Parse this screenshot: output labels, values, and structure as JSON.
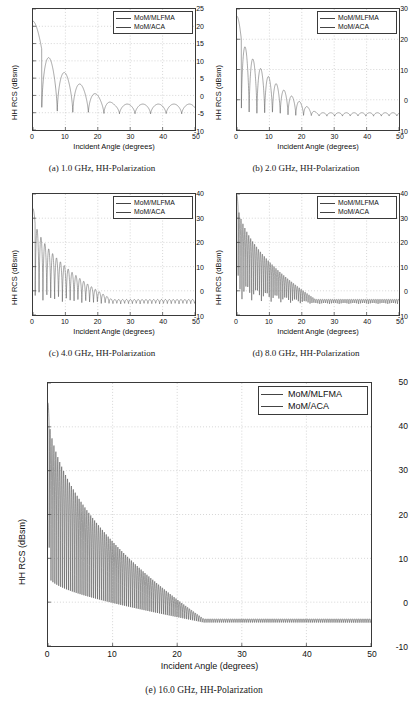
{
  "figure": {
    "axis_x_label": "Incident Angle (degrees)",
    "axis_y_label": "HH RCS (dBsm)",
    "legend": [
      "MoM/MLFMA",
      "MoM/ACA"
    ],
    "line_color": "#4d4d4d",
    "grid_color": "#b9b9b9",
    "axis_color": "#3a3a3a"
  },
  "captions": {
    "a": "(a)  1.0 GHz, HH-Polarization",
    "b": "(b)  2.0 GHz, HH-Polarization",
    "c": "(c)  4.0 GHz, HH-Polarization",
    "d": "(d)  8.0 GHz, HH-Polarization",
    "e": "(e)  16.0 GHz, HH-Polarization"
  },
  "xticks": [
    "0",
    "10",
    "20",
    "30",
    "40",
    "50"
  ],
  "yticks": {
    "a": [
      "25",
      "20",
      "15",
      "10",
      "5",
      "0",
      "-5",
      "-10"
    ],
    "b": [
      "30",
      "20",
      "10",
      "0",
      "-10"
    ],
    "c": [
      "40",
      "30",
      "20",
      "10",
      "0",
      "-10"
    ],
    "d": [
      "40",
      "30",
      "20",
      "10",
      "0",
      "-10"
    ],
    "e": [
      "50",
      "40",
      "30",
      "20",
      "10",
      "0",
      "-10"
    ]
  },
  "chart_data": [
    {
      "id": "a",
      "type": "line",
      "title": "(a)  1.0 GHz, HH-Polarization",
      "frequency_ghz": 1.0,
      "polarization": "HH",
      "xlabel": "Incident Angle (degrees)",
      "ylabel": "HH RCS (dBsm)",
      "xlim": [
        0,
        50
      ],
      "ylim": [
        -10,
        25
      ],
      "xticks": [
        0,
        10,
        20,
        30,
        40,
        50
      ],
      "yticks": [
        -10,
        -5,
        0,
        5,
        10,
        15,
        20,
        25
      ],
      "grid": true,
      "legend": [
        "MoM/MLFMA",
        "MoM/ACA"
      ],
      "legend_position": "upper-right",
      "lobe_peaks_x": [
        0.5,
        12.5,
        22.0,
        31.5,
        41.5
      ],
      "lobe_peaks_y": [
        21.5,
        8.4,
        3.9,
        0.4,
        -1.2
      ],
      "null_x": [
        8.3,
        17.5,
        27.0,
        36.5,
        46.5
      ],
      "null_y": [
        -5.8,
        -5.3,
        -5.0,
        -4.6,
        -5.8
      ],
      "oscillation_period_deg": 9.6,
      "envelope_start_db": 21.5,
      "envelope_end_db": -1.5
    },
    {
      "id": "b",
      "type": "line",
      "title": "(b)  2.0 GHz, HH-Polarization",
      "frequency_ghz": 2.0,
      "polarization": "HH",
      "xlabel": "Incident Angle (degrees)",
      "ylabel": "HH RCS (dBsm)",
      "xlim": [
        0,
        50
      ],
      "ylim": [
        -10,
        30
      ],
      "xticks": [
        0,
        10,
        20,
        30,
        40,
        50
      ],
      "yticks": [
        -10,
        0,
        10,
        20,
        30
      ],
      "grid": true,
      "legend": [
        "MoM/MLFMA",
        "MoM/ACA"
      ],
      "legend_position": "upper-right",
      "lobe_peaks_x": [
        0.3,
        6.4,
        10.2,
        15.0,
        19.8,
        24.2,
        29.0,
        34.0,
        39.0,
        44.5,
        49.0
      ],
      "lobe_peaks_y": [
        27.6,
        14.2,
        9.6,
        6.6,
        4.9,
        3.0,
        1.2,
        0.0,
        -1.0,
        -2.2,
        -3.3
      ],
      "oscillation_period_deg": 4.8,
      "envelope_start_db": 27.6,
      "envelope_end_db": -3.3
    },
    {
      "id": "c",
      "type": "line",
      "title": "(c)  4.0 GHz, HH-Polarization",
      "frequency_ghz": 4.0,
      "polarization": "HH",
      "xlabel": "Incident Angle (degrees)",
      "ylabel": "HH RCS (dBsm)",
      "xlim": [
        0,
        50
      ],
      "ylim": [
        -10,
        40
      ],
      "xticks": [
        0,
        10,
        20,
        30,
        40,
        50
      ],
      "yticks": [
        -10,
        0,
        10,
        20,
        30,
        40
      ],
      "grid": true,
      "legend": [
        "MoM/MLFMA",
        "MoM/ACA"
      ],
      "legend_position": "upper-right",
      "lobe_peaks_x": [
        0.4,
        2.6,
        4.9,
        7.2,
        9.6,
        12.0,
        16.0,
        20.0,
        25.0,
        30.0,
        35.0,
        40.0,
        45.0,
        49.5
      ],
      "lobe_peaks_y": [
        34.0,
        20.0,
        16.5,
        12.5,
        9.0,
        7.0,
        5.0,
        3.5,
        2.0,
        1.0,
        0.0,
        -1.0,
        -1.8,
        -2.6
      ],
      "oscillation_period_deg": 2.4,
      "envelope_start_db": 34.0,
      "envelope_end_db": -2.6
    },
    {
      "id": "d",
      "type": "line",
      "title": "(d)  8.0 GHz, HH-Polarization",
      "frequency_ghz": 8.0,
      "polarization": "HH",
      "xlabel": "Incident Angle (degrees)",
      "ylabel": "HH RCS (dBsm)",
      "xlim": [
        0,
        50
      ],
      "ylim": [
        -10,
        40
      ],
      "xticks": [
        0,
        10,
        20,
        30,
        40,
        50
      ],
      "yticks": [
        -10,
        0,
        10,
        20,
        30,
        40
      ],
      "grid": true,
      "legend": [
        "MoM/MLFMA",
        "MoM/ACA"
      ],
      "legend_position": "upper-right",
      "lobe_peaks_x": [
        0.2,
        1.5,
        3.0,
        5.0,
        8.0,
        12.0,
        16.0,
        20.0,
        25.0,
        30.0,
        35.0,
        40.0,
        45.0,
        49.5
      ],
      "lobe_peaks_y": [
        39.5,
        26.0,
        21.0,
        15.0,
        11.0,
        8.0,
        6.0,
        4.5,
        3.0,
        1.5,
        0.5,
        -0.5,
        -1.5,
        -2.5
      ],
      "oscillation_period_deg": 1.2,
      "envelope_start_db": 39.5,
      "envelope_end_db": -2.5
    },
    {
      "id": "e",
      "type": "line",
      "title": "(e)  16.0 GHz, HH-Polarization",
      "frequency_ghz": 16.0,
      "polarization": "HH",
      "xlabel": "Incident Angle (degrees)",
      "ylabel": "HH RCS (dBsm)",
      "xlim": [
        0,
        50
      ],
      "ylim": [
        -10,
        50
      ],
      "xticks": [
        0,
        10,
        20,
        30,
        40,
        50
      ],
      "yticks": [
        -10,
        0,
        10,
        20,
        30,
        40,
        50
      ],
      "grid": true,
      "legend": [
        "MoM/MLFMA",
        "MoM/ACA"
      ],
      "legend_position": "upper-right",
      "lobe_peaks_x": [
        0.2,
        1.2,
        2.5,
        4.0,
        6.0,
        8.0,
        10.0,
        14.0,
        18.0,
        22.0,
        26.0,
        30.0,
        35.0,
        40.0,
        45.0,
        50.0
      ],
      "lobe_peaks_y": [
        45.5,
        32.0,
        24.0,
        19.0,
        15.0,
        13.0,
        11.0,
        8.0,
        6.0,
        4.0,
        2.5,
        1.0,
        0.0,
        -1.0,
        -2.0,
        -2.8
      ],
      "oscillation_period_deg": 0.6,
      "envelope_start_db": 45.5,
      "envelope_end_db": -2.8,
      "floor_db": -5.0
    }
  ]
}
